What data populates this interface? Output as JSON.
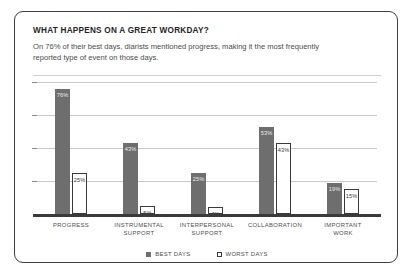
{
  "card": {
    "title": "WHAT HAPPENS ON A GREAT WORKDAY?",
    "subtitle": "On 76% of their best days, diarists mentioned progress, making it the most frequently reported type of event on those days."
  },
  "chart_data": {
    "type": "bar",
    "title": "WHAT HAPPENS ON A GREAT WORKDAY?",
    "subtitle": "On 76% of their best days, diarists mentioned progress, making it the most frequently reported type of event on those days.",
    "xlabel": "",
    "ylabel": "",
    "ylim": [
      0,
      80
    ],
    "grid": true,
    "gridlines": [
      20,
      40,
      60,
      80
    ],
    "legend_position": "bottom-center",
    "categories": [
      "PROGRESS",
      "INSTRUMENTAL SUPPORT",
      "INTERPERSONAL SUPPORT",
      "COLLABORATION",
      "IMPORTANT WORK"
    ],
    "series": [
      {
        "name": "BEST DAYS",
        "color": "#6e6e6e",
        "style": "filled",
        "values": [
          76,
          43,
          25,
          53,
          19
        ],
        "labels": [
          "76%",
          "43%",
          "25%",
          "53%",
          "19%"
        ]
      },
      {
        "name": "WORST DAYS",
        "color": "#ffffff",
        "style": "outlined",
        "values": [
          25,
          5,
          4,
          43,
          15
        ],
        "labels": [
          "25%",
          "5%",
          "4%",
          "43%",
          "15%"
        ]
      }
    ]
  }
}
